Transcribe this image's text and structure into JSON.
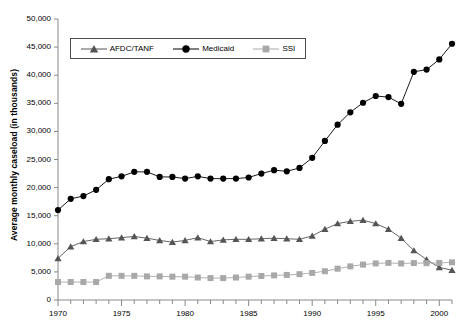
{
  "chart_data": {
    "type": "line",
    "title": "",
    "xlabel": "",
    "ylabel": "Average monthly caseload (in thousands)",
    "ylim": [
      0,
      50000
    ],
    "xlim": [
      1970,
      2001
    ],
    "ytick_labels": [
      "0",
      "5,000",
      "10,000",
      "15,000",
      "20,000",
      "25,000",
      "30,000",
      "35,000",
      "40,000",
      "45,000",
      "50,000"
    ],
    "ytick_values": [
      0,
      5000,
      10000,
      15000,
      20000,
      25000,
      30000,
      35000,
      40000,
      45000,
      50000
    ],
    "xtick_labels": [
      "1970",
      "1975",
      "1980",
      "1985",
      "1990",
      "1995",
      "2000"
    ],
    "xtick_values": [
      1970,
      1975,
      1980,
      1985,
      1990,
      1995,
      2000
    ],
    "grid": false,
    "legend_position": "top-left-inside",
    "x": [
      1970,
      1971,
      1972,
      1973,
      1974,
      1975,
      1976,
      1977,
      1978,
      1979,
      1980,
      1981,
      1982,
      1983,
      1984,
      1985,
      1986,
      1987,
      1988,
      1989,
      1990,
      1991,
      1992,
      1993,
      1994,
      1995,
      1996,
      1997,
      1998,
      1999,
      2000,
      2001
    ],
    "series": [
      {
        "name": "AFDC/TANF",
        "marker": "triangle",
        "color": "#555555",
        "values": [
          7400,
          9500,
          10400,
          10800,
          10900,
          11100,
          11300,
          11000,
          10600,
          10300,
          10600,
          11100,
          10400,
          10700,
          10800,
          10800,
          10900,
          11000,
          10900,
          10800,
          11400,
          12600,
          13600,
          14000,
          14200,
          13600,
          12600,
          11000,
          8800,
          7200,
          5800,
          5300
        ]
      },
      {
        "name": "Medicaid",
        "marker": "circle",
        "color": "#000000",
        "values": [
          16000,
          18000,
          18500,
          19600,
          21500,
          22000,
          22800,
          22800,
          21900,
          21900,
          21600,
          22000,
          21600,
          21600,
          21600,
          21800,
          22500,
          23100,
          22900,
          23500,
          25300,
          28300,
          31200,
          33400,
          35100,
          36300,
          36100,
          34900,
          40600,
          41000,
          42800,
          45600
        ]
      },
      {
        "name": "SSI",
        "marker": "square",
        "color": "#a8a8a8",
        "values": [
          3200,
          3200,
          3200,
          3200,
          4300,
          4300,
          4300,
          4200,
          4200,
          4150,
          4150,
          4000,
          3900,
          3900,
          4000,
          4150,
          4270,
          4380,
          4460,
          4590,
          4820,
          5120,
          5570,
          5980,
          6300,
          6510,
          6600,
          6500,
          6570,
          6560,
          6600,
          6700
        ]
      }
    ]
  },
  "legend": {
    "items": [
      {
        "label": "AFDC/TANF"
      },
      {
        "label": "Medicaid"
      },
      {
        "label": "SSI"
      }
    ]
  }
}
